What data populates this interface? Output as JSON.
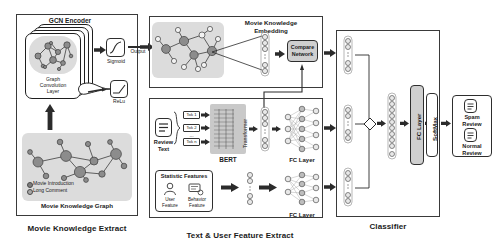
{
  "diagram": {
    "type": "flow-diagram"
  },
  "sections": {
    "movie_knowledge_extract": {
      "caption": "Movie Knowledge Extract",
      "encoder_title": "GCN Encoder",
      "gcn_layer_label": "Graph\nConvolution\nLayer",
      "gcn_layer_line1": "Graph",
      "gcn_layer_line2": "Convolution",
      "gcn_layer_line3": "Layer",
      "sigmoid_label": "Sigmoid",
      "relu_label": "ReLu",
      "output_label": "Output",
      "graph_title": "Movie Knowledge Graph",
      "legend": [
        {
          "label": "Movie Introduction",
          "color": "#7d7d7d"
        },
        {
          "label": "Long Comment",
          "color": "#a8a8a8"
        }
      ]
    },
    "movie_knowledge_embedding": {
      "title_line1": "Movie Knowledge",
      "title_line2": "Embedding",
      "compare_network_line1": "Compare",
      "compare_network_line2": "Network"
    },
    "text_user_feature_extract": {
      "caption": "Text & User Feature Extract",
      "review_text_line1": "Review",
      "review_text_line2": "Text",
      "tokens": [
        "Tok 1",
        "Tok 2",
        "Tok n"
      ],
      "token_ellipsis": "...",
      "bert_label": "BERT",
      "bert_inner_text": "Transformer",
      "fc_layer_text_label": "FC Layer",
      "statistic_features_title": "Statistic Features",
      "user_feature_line1": "User",
      "user_feature_line2": "Feature",
      "behavior_feature_line1": "Behavior",
      "behavior_feature_line2": "Feature",
      "fc_layer_static_label": "FC Layer"
    },
    "classifier": {
      "caption": "Classifier",
      "fc_layer_label": "FC Layer",
      "softmax_label": "SoftMax"
    },
    "outputs": {
      "spam_line1": "Spam",
      "spam_line2": "Review",
      "normal_line1": "Normal",
      "normal_line2": "Review"
    }
  },
  "colors": {
    "stroke": "#2e2e2e",
    "gray_block": "#d9d9d9",
    "node_dark": "#8c8c8c",
    "node_light": "#f2f2f2",
    "box_gray": "#cfcfcf"
  }
}
